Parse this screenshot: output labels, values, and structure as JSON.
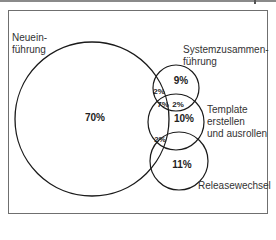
{
  "diagram": {
    "type": "venn",
    "sets": [
      {
        "id": "neueinfuehrung",
        "label": "Neuein-\nführung",
        "exclusive_pct": "70%"
      },
      {
        "id": "systemzusammenfuehrung",
        "label": "Systemzusammen-\nführung",
        "exclusive_pct": "9%"
      },
      {
        "id": "template",
        "label": "Template\nerstellen\nund ausrollen",
        "exclusive_pct": "10%"
      },
      {
        "id": "releasewechsel",
        "label": "Releasewechsel",
        "exclusive_pct": "11%"
      }
    ],
    "intersections": [
      {
        "sets": [
          "neueinfuehrung",
          "systemzusammenfuehrung"
        ],
        "pct": "2%"
      },
      {
        "sets": [
          "neueinfuehrung",
          "systemzusammenfuehrung",
          "template"
        ],
        "pct": "7%"
      },
      {
        "sets": [
          "systemzusammenfuehrung",
          "template"
        ],
        "pct": "2%"
      },
      {
        "sets": [
          "neueinfuehrung",
          "template",
          "releasewechsel"
        ],
        "pct": "2%"
      }
    ],
    "stroke_color": "#1a1a1a",
    "frame_color": "#6f6f6f"
  }
}
